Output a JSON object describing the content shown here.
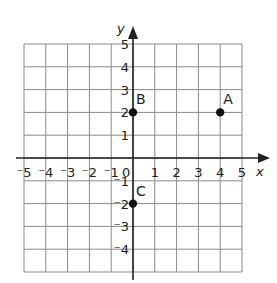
{
  "chart_data": {
    "type": "scatter",
    "title": "",
    "xlabel": "x",
    "ylabel": "y",
    "xlim": [
      -5,
      5
    ],
    "ylim": [
      -5,
      5
    ],
    "grid": true,
    "legend": null,
    "x_ticks": [
      "-5",
      "-4",
      "-3",
      "-2",
      "-1",
      "0",
      "1",
      "2",
      "3",
      "4",
      "5"
    ],
    "y_ticks": [
      "-4",
      "-3",
      "-2",
      "-1",
      "1",
      "2",
      "3",
      "4",
      "5"
    ],
    "origin_label": "0",
    "points": [
      {
        "label": "A",
        "x": 4,
        "y": 2
      },
      {
        "label": "B",
        "x": 0,
        "y": 2
      },
      {
        "label": "C",
        "x": 0,
        "y": -2
      }
    ]
  },
  "colors": {
    "grid": "#8a8a8a",
    "axis": "#222222",
    "point": "#111111",
    "background": "#ffffff"
  }
}
